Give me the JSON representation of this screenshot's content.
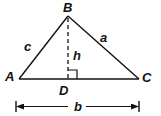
{
  "diagram": {
    "vertices": {
      "A": {
        "label": "A",
        "x": 19,
        "y": 79
      },
      "B": {
        "label": "B",
        "x": 68,
        "y": 16
      },
      "C": {
        "label": "C",
        "x": 139,
        "y": 79
      },
      "D": {
        "label": "D",
        "x": 68,
        "y": 79
      }
    },
    "sides": {
      "a": {
        "label": "a",
        "from": "B",
        "to": "C"
      },
      "b": {
        "label": "b",
        "from": "A",
        "to": "C"
      },
      "c": {
        "label": "c",
        "from": "A",
        "to": "B"
      }
    },
    "altitude": {
      "label": "h",
      "from": "B",
      "to": "D",
      "style": "dashed"
    },
    "right_angle_marker": {
      "at": "D"
    },
    "dimension": {
      "label": "b",
      "description": "base width arrow"
    },
    "stroke_color": "#111111",
    "background_color": "#ffffff"
  }
}
